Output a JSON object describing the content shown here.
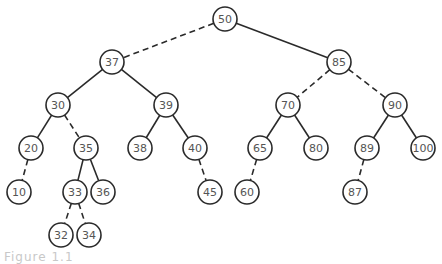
{
  "diagram": {
    "type": "binary-search-tree",
    "node_radius": 12,
    "colors": {
      "stroke": "#2a2a2a",
      "label": "#555555",
      "background": "#ffffff"
    },
    "nodes": [
      {
        "id": "50",
        "label": "50",
        "x": 225,
        "y": 19
      },
      {
        "id": "37",
        "label": "37",
        "x": 112,
        "y": 62
      },
      {
        "id": "85",
        "label": "85",
        "x": 339,
        "y": 62
      },
      {
        "id": "30",
        "label": "30",
        "x": 58,
        "y": 105
      },
      {
        "id": "39",
        "label": "39",
        "x": 166,
        "y": 105
      },
      {
        "id": "70",
        "label": "70",
        "x": 288,
        "y": 105
      },
      {
        "id": "90",
        "label": "90",
        "x": 395,
        "y": 105
      },
      {
        "id": "20",
        "label": "20",
        "x": 31,
        "y": 148
      },
      {
        "id": "35",
        "label": "35",
        "x": 86,
        "y": 148
      },
      {
        "id": "38",
        "label": "38",
        "x": 140,
        "y": 148
      },
      {
        "id": "40",
        "label": "40",
        "x": 195,
        "y": 148
      },
      {
        "id": "65",
        "label": "65",
        "x": 260,
        "y": 148
      },
      {
        "id": "80",
        "label": "80",
        "x": 316,
        "y": 148
      },
      {
        "id": "89",
        "label": "89",
        "x": 367,
        "y": 148
      },
      {
        "id": "100",
        "label": "100",
        "x": 423,
        "y": 148
      },
      {
        "id": "10",
        "label": "10",
        "x": 19,
        "y": 192
      },
      {
        "id": "33",
        "label": "33",
        "x": 75,
        "y": 192
      },
      {
        "id": "36",
        "label": "36",
        "x": 103,
        "y": 192
      },
      {
        "id": "45",
        "label": "45",
        "x": 210,
        "y": 192
      },
      {
        "id": "60",
        "label": "60",
        "x": 247,
        "y": 192
      },
      {
        "id": "87",
        "label": "87",
        "x": 355,
        "y": 192
      },
      {
        "id": "32",
        "label": "32",
        "x": 61,
        "y": 235
      },
      {
        "id": "34",
        "label": "34",
        "x": 89,
        "y": 235
      }
    ],
    "edges": [
      {
        "from": "50",
        "to": "37",
        "style": "dashed"
      },
      {
        "from": "50",
        "to": "85",
        "style": "solid"
      },
      {
        "from": "37",
        "to": "30",
        "style": "solid"
      },
      {
        "from": "37",
        "to": "39",
        "style": "solid"
      },
      {
        "from": "85",
        "to": "70",
        "style": "dashed"
      },
      {
        "from": "85",
        "to": "90",
        "style": "dashed"
      },
      {
        "from": "30",
        "to": "20",
        "style": "solid"
      },
      {
        "from": "30",
        "to": "35",
        "style": "dashed"
      },
      {
        "from": "39",
        "to": "38",
        "style": "solid"
      },
      {
        "from": "39",
        "to": "40",
        "style": "solid"
      },
      {
        "from": "70",
        "to": "65",
        "style": "solid"
      },
      {
        "from": "70",
        "to": "80",
        "style": "solid"
      },
      {
        "from": "90",
        "to": "89",
        "style": "solid"
      },
      {
        "from": "90",
        "to": "100",
        "style": "solid"
      },
      {
        "from": "20",
        "to": "10",
        "style": "dashed"
      },
      {
        "from": "35",
        "to": "33",
        "style": "solid"
      },
      {
        "from": "35",
        "to": "36",
        "style": "solid"
      },
      {
        "from": "40",
        "to": "45",
        "style": "dashed"
      },
      {
        "from": "65",
        "to": "60",
        "style": "dashed"
      },
      {
        "from": "89",
        "to": "87",
        "style": "dashed"
      },
      {
        "from": "33",
        "to": "32",
        "style": "dashed"
      },
      {
        "from": "33",
        "to": "34",
        "style": "dashed"
      }
    ]
  },
  "caption": {
    "text": "Figure 1.1"
  }
}
